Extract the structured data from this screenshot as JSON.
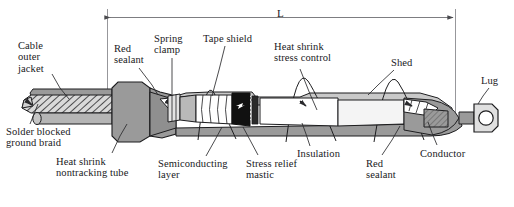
{
  "figure": {
    "kind": "technical-cutaway-diagram",
    "dimension": {
      "label": "L",
      "style": "double-arrow-overall-length"
    },
    "colors": {
      "outline": "#1d1d1f",
      "body_gray": "#9a9a9a",
      "light_gray": "#c9c9c9",
      "pale": "#e8e8e8",
      "white": "#ffffff",
      "black_mastic": "#111111",
      "paper": "#ffffff",
      "text": "#19191c",
      "leader": "#2a2a2d"
    },
    "labels": [
      {
        "id": "cable-outer-jacket",
        "text": "Cable\nouter\njacket",
        "x": 18,
        "y": 40,
        "align": "left",
        "leader": [
          [
            52,
            74
          ],
          [
            60,
            88
          ],
          [
            69,
            99
          ]
        ]
      },
      {
        "id": "red-sealant-left",
        "text": "Red\nsealant",
        "x": 114,
        "y": 43,
        "align": "left",
        "leader": [
          [
            139,
            68
          ],
          [
            152,
            85
          ],
          [
            158,
            95
          ]
        ]
      },
      {
        "id": "spring-clamp",
        "text": "Spring\nclamp",
        "x": 154,
        "y": 33,
        "align": "left",
        "leader": [
          [
            172,
            58
          ],
          [
            172,
            80
          ],
          [
            172,
            94
          ]
        ]
      },
      {
        "id": "tape-shield",
        "text": "Tape shield",
        "x": 203,
        "y": 33,
        "align": "left",
        "leader": [
          [
            225,
            46
          ],
          [
            219,
            70
          ],
          [
            212,
            96
          ]
        ]
      },
      {
        "id": "heat-shrink-stress-control",
        "text": "Heat shrink\nstress control",
        "x": 274,
        "y": 41,
        "align": "left",
        "leader": [
          [
            300,
            69
          ],
          [
            310,
            94
          ],
          [
            317,
            110
          ]
        ]
      },
      {
        "id": "shed",
        "text": "Shed",
        "x": 391,
        "y": 57,
        "align": "left",
        "leader": [
          [
            394,
            70
          ],
          [
            378,
            85
          ],
          [
            368,
            95
          ]
        ]
      },
      {
        "id": "lug",
        "text": "Lug",
        "x": 481,
        "y": 75,
        "align": "left",
        "leader": [
          [
            489,
            88
          ],
          [
            483,
            96
          ],
          [
            478,
            104
          ]
        ]
      },
      {
        "id": "solder-blocked-ground-braid",
        "text": "Solder blocked\nground braid",
        "x": 6,
        "y": 126,
        "align": "left",
        "leader": [
          [
            30,
            124
          ],
          [
            34,
            114
          ],
          [
            38,
            104
          ]
        ]
      },
      {
        "id": "heat-shrink-nontracking-tube",
        "text": "Heat shrink\nnontracking tube",
        "x": 56,
        "y": 156,
        "align": "left",
        "leader": [
          [
            112,
            153
          ],
          [
            120,
            136
          ],
          [
            127,
            124
          ]
        ]
      },
      {
        "id": "semiconducting-layer",
        "text": "Semiconducting\nlayer",
        "x": 158,
        "y": 158,
        "align": "left",
        "leader": [
          [
            206,
            156
          ],
          [
            215,
            140
          ],
          [
            222,
            127
          ]
        ]
      },
      {
        "id": "stress-relief-mastic",
        "text": "Stress relief\nmastic",
        "x": 246,
        "y": 158,
        "align": "left",
        "leader": [
          [
            258,
            155
          ],
          [
            250,
            140
          ],
          [
            243,
            127
          ]
        ]
      },
      {
        "id": "insulation",
        "text": "Insulation",
        "x": 297,
        "y": 148,
        "align": "left",
        "leader": [
          [
            310,
            146
          ],
          [
            306,
            134
          ],
          [
            302,
            123
          ]
        ]
      },
      {
        "id": "red-sealant-right",
        "text": "Red\nsealant",
        "x": 366,
        "y": 158,
        "align": "left",
        "leader": [
          [
            382,
            155
          ],
          [
            392,
            140
          ],
          [
            400,
            126
          ]
        ]
      },
      {
        "id": "conductor",
        "text": "Conductor",
        "x": 420,
        "y": 148,
        "align": "left",
        "leader": [
          [
            437,
            145
          ],
          [
            432,
            133
          ],
          [
            428,
            122
          ]
        ]
      }
    ]
  }
}
